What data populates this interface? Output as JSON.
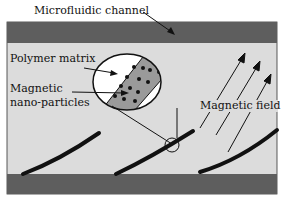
{
  "labels": {
    "channel": "Microfluidic channel",
    "polymer": "Polymer matrix",
    "magnetic_line1": "Magnetic",
    "magnetic_line2": "nano-particles",
    "field": "Magnetic field"
  },
  "colors": {
    "wall": "#5e5e5e",
    "channel_fill": "#dcdcdc",
    "matrix_fill": "#9a9a9a",
    "ellipse_fill": "#ffffff",
    "stroke": "#111111"
  }
}
